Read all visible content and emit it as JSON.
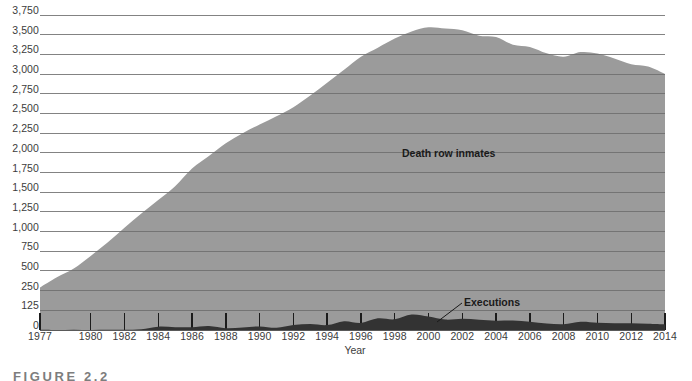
{
  "chart_data": {
    "type": "area",
    "title": "",
    "xlabel": "Year",
    "ylabel": "",
    "grid": true,
    "legend_position": "inline-annotations",
    "x": [
      1977,
      1978,
      1979,
      1980,
      1981,
      1982,
      1983,
      1984,
      1985,
      1986,
      1987,
      1988,
      1989,
      1990,
      1991,
      1992,
      1993,
      1994,
      1995,
      1996,
      1997,
      1998,
      1999,
      2000,
      2001,
      2002,
      2003,
      2004,
      2005,
      2006,
      2007,
      2008,
      2009,
      2010,
      2011,
      2012,
      2013,
      2014
    ],
    "xtick_labels": [
      "1977",
      "1980",
      "1982",
      "1984",
      "1986",
      "1988",
      "1990",
      "1992",
      "1994",
      "1996",
      "1998",
      "2000",
      "2002",
      "2004",
      "2006",
      "2008",
      "2010",
      "2012",
      "2014"
    ],
    "xtick_values": [
      1977,
      1980,
      1982,
      1984,
      1986,
      1988,
      1990,
      1992,
      1994,
      1996,
      1998,
      2000,
      2002,
      2004,
      2006,
      2008,
      2010,
      2012,
      2014
    ],
    "xlim": [
      1977,
      2014
    ],
    "ytick_labels": [
      "0",
      "125",
      "250",
      "500",
      "750",
      "1,000",
      "1,250",
      "1,500",
      "1,750",
      "2,000",
      "2,250",
      "2,500",
      "2,750",
      "3,000",
      "3,250",
      "3,500",
      "3,750"
    ],
    "ytick_values": [
      0,
      125,
      250,
      500,
      750,
      1000,
      1250,
      1500,
      1750,
      2000,
      2250,
      2500,
      2750,
      3000,
      3250,
      3500,
      3750
    ],
    "y_axis_note": "broken scale: 0-125-250 share the same spacing as the 250 increments above",
    "series": [
      {
        "name": "Death row inmates",
        "color": "#9b9b9b",
        "values": [
          290,
          420,
          530,
          690,
          860,
          1050,
          1230,
          1400,
          1575,
          1800,
          1960,
          2120,
          2250,
          2360,
          2465,
          2580,
          2727,
          2890,
          3054,
          3219,
          3335,
          3452,
          3540,
          3593,
          3577,
          3557,
          3487,
          3471,
          3373,
          3344,
          3263,
          3220,
          3279,
          3261,
          3199,
          3125,
          3095,
          3002
        ]
      },
      {
        "name": "Executions",
        "color": "#333333",
        "values": [
          1,
          0,
          2,
          0,
          1,
          2,
          5,
          21,
          18,
          18,
          25,
          11,
          16,
          23,
          14,
          31,
          38,
          31,
          56,
          45,
          74,
          68,
          98,
          85,
          66,
          71,
          65,
          59,
          60,
          53,
          42,
          37,
          52,
          46,
          43,
          43,
          39,
          35
        ]
      }
    ],
    "annotations": [
      {
        "text": "Death row inmates",
        "series": "Death row inmates"
      },
      {
        "text": "Executions",
        "series": "Executions"
      }
    ]
  },
  "axis": {
    "x_title": "Year"
  },
  "caption": {
    "text": "FIGURE 2.2"
  },
  "colors": {
    "death_row_fill": "#9b9b9b",
    "executions_fill": "#333333",
    "gridline": "#6e6e6e",
    "gridline_over_fill": "#6f6f6f",
    "text": "#3c3c3c",
    "background": "#ffffff"
  }
}
